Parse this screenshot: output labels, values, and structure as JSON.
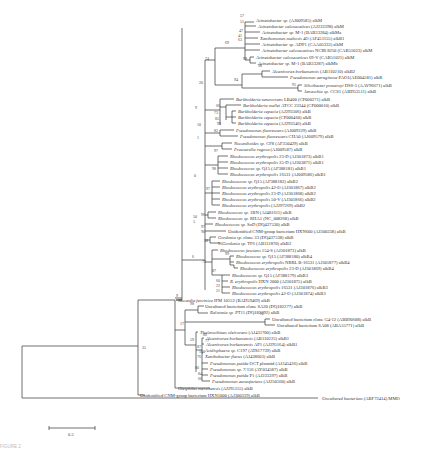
{
  "figure": {
    "type": "phylogenetic-tree",
    "caption": "FIGURE 2",
    "scale_bar": {
      "label": "0.5"
    },
    "outgroup": {
      "name": "Uncultured bacterium",
      "acc": "(ABF72414) MMO"
    }
  },
  "taxa": [
    {
      "y": 20,
      "x": 256,
      "genus": "Acinetobacter sp.",
      "rest": "(AJ009585) alkM"
    },
    {
      "y": 26,
      "x": 258,
      "genus": "Acinetobacter calcoaceticus",
      "rest": "(AJ233398) alkM"
    },
    {
      "y": 32,
      "x": 262,
      "genus": "Acinetobacter sp.",
      "rest": "M-1 (BAB33284) alkMa"
    },
    {
      "y": 38,
      "x": 260,
      "genus": "Xanthomonas maltosis",
      "rest": "4O (AF451155) alkB1"
    },
    {
      "y": 44,
      "x": 262,
      "genus": "Acinetobacter sp.",
      "rest": "ADP1 (CAA05333) alkM"
    },
    {
      "y": 50,
      "x": 262,
      "genus": "Acinetobacter calcoaceticus",
      "rest": "NCIB 8250 (CAB51023) alkM"
    },
    {
      "y": 57,
      "x": 256,
      "genus": "Acinetobacter calcoaceticus",
      "rest": "69-V (CAB51021) alkM"
    },
    {
      "y": 63,
      "x": 258,
      "genus": "Acinetobacter sp.",
      "rest": "M-1 (BAB33287) alkMb"
    },
    {
      "y": 71,
      "x": 272,
      "genus": "Alcanivorax borkumensis",
      "rest": "(AB110210) alkB2"
    },
    {
      "y": 77,
      "x": 290,
      "genus": "Pseudomonas aeruginosa",
      "rest": "PAO1(AE004581) alkB"
    },
    {
      "y": 85,
      "x": 304,
      "genus": "Silicibacter pomeroyi",
      "rest": "DSS-3 (AAV96671) alkB"
    },
    {
      "y": 91,
      "x": 304,
      "genus": "Janaschia sp.",
      "rest": "CCS1 (ABD53511) alkB"
    },
    {
      "y": 99,
      "x": 236,
      "genus": "Burkholderia xenovorans",
      "rest": "LB400 (CP000271) alkB"
    },
    {
      "y": 105,
      "x": 243,
      "genus": "Burkholderia mallei",
      "rest": "ATCC 23344 (CP000010) alkB"
    },
    {
      "y": 111,
      "x": 238,
      "genus": "Burkholderia cepacia",
      "rest": "(AJ293306) alkB"
    },
    {
      "y": 117,
      "x": 238,
      "genus": "Burkholderia cepacia",
      "rest": "(CP000460) alkB"
    },
    {
      "y": 123,
      "x": 238,
      "genus": "Burkholderia cepacia",
      "rest": "(AJ293346) alkB"
    },
    {
      "y": 130,
      "x": 236,
      "genus": "Pseudomonas fluorescens",
      "rest": "(AJ009329) alkB"
    },
    {
      "y": 136,
      "x": 240,
      "genus": "Pseudomonas fluorescens",
      "rest": "CHA0 (AJ009579) alkB"
    },
    {
      "y": 143,
      "x": 234,
      "genus": "Nocardioides sp.",
      "rest": "CF8 (AF350429) alkB"
    },
    {
      "y": 149,
      "x": 234,
      "genus": "Prauserella rugosa",
      "rest": "(AJ009587) alkB"
    },
    {
      "y": 156,
      "x": 230,
      "genus": "Rhodococcus erythropolis",
      "rest": "23-D (AJ301873) alkB1"
    },
    {
      "y": 162,
      "x": 230,
      "genus": "Rhodococcus erythropolis",
      "rest": "35-D (AJ303871) alkB1"
    },
    {
      "y": 168,
      "x": 230,
      "genus": "Rhodococcus sp.",
      "rest": "Q15 (AF388181) alkB1"
    },
    {
      "y": 174,
      "x": 230,
      "genus": "Rhodococcus erythropolis",
      "rest": "16531 (AJ009586) alkB1"
    },
    {
      "y": 181,
      "x": 222,
      "genus": "Rhodococcus sp.",
      "rest": "Q15 (AF388182) alkB2"
    },
    {
      "y": 187,
      "x": 222,
      "genus": "Rhodococcus erythropolis",
      "rest": "42-O (AJ301867) alkB2"
    },
    {
      "y": 193,
      "x": 222,
      "genus": "Rhodococcus erythropolis",
      "rest": "23-D (AJ301868) alkB2"
    },
    {
      "y": 199,
      "x": 222,
      "genus": "Rhodococcus erythropolis",
      "rest": "50-V (AJ301866) alkB2"
    },
    {
      "y": 205,
      "x": 222,
      "genus": "Rhodococcus erythropolis",
      "rest": "(AJ297269) alkB2"
    },
    {
      "y": 212,
      "x": 218,
      "genus": "Rhodococcus sp.",
      "rest": "1BN (AJ401611) alkB"
    },
    {
      "y": 218,
      "x": 218,
      "genus": "Rhodococcus sp.",
      "rest": "RHA1 (NC_008268) alkB"
    },
    {
      "y": 224,
      "x": 215,
      "genus": "Rhodococcus sp.",
      "rest": "SoD (DQ437530) alkB"
    },
    {
      "y": 231,
      "x": 228,
      "genus": "",
      "rest": "Unidentified CNM-group bacterium HXN600 (AJ300338) alkB"
    },
    {
      "y": 237,
      "x": 218,
      "genus": "Gordonia sp.",
      "rest": "clone 33 (DQ437538) alkB"
    },
    {
      "y": 243,
      "x": 222,
      "genus": "Gordonia sp.",
      "rest": "TF6 (AB112870) alkB2"
    },
    {
      "y": 250,
      "x": 220,
      "genus": "Rhodococcus fascians",
      "rest": "154-S (AJ301873) alkB"
    },
    {
      "y": 256,
      "x": 236,
      "genus": "Rhodococcus sp.",
      "rest": "Q15 (AF388180) alkB4"
    },
    {
      "y": 262,
      "x": 236,
      "genus": "Rhodococcus erythropolis",
      "rest": "NRRL B-16531 (AJ301877) alkB4"
    },
    {
      "y": 268,
      "x": 240,
      "genus": "Rhodococcus erythropolis",
      "rest": "23-D (AJ301869) alkB4"
    },
    {
      "y": 275,
      "x": 232,
      "genus": "Rhodococcus sp.",
      "rest": "Q15 (AF388179) alkB3"
    },
    {
      "y": 281,
      "x": 230,
      "genus": "R. erythropolis",
      "rest": "HXN 2000 (AJ301875) alkB"
    },
    {
      "y": 287,
      "x": 232,
      "genus": "Rhodococcus erythropolis",
      "rest": "16531 (AJ301876) alkB3"
    },
    {
      "y": 293,
      "x": 232,
      "genus": "Rhodococcus erythropolis",
      "rest": "42-O (AJ301874) alkB3"
    },
    {
      "y": 300,
      "x": 178,
      "genus": "Nocardia farcinica",
      "rest": "IFM 10152 (BAD59469) alkB"
    },
    {
      "y": 306,
      "x": 205,
      "genus": "",
      "rest": "Uncultured bacterium clone SA20 (DQ182277) alkB"
    },
    {
      "y": 312,
      "x": 210,
      "genus": "Ralstonia sp.",
      "rest": "PT11 (DQ182292) alkB"
    },
    {
      "y": 319,
      "x": 272,
      "genus": "",
      "rest": "Uncultured bacterium clone G4-12 (ABB90688) alkB"
    },
    {
      "y": 325,
      "x": 277,
      "genus": "",
      "rest": "Uncultured bacterium SA08 (ABA55771) alkB"
    },
    {
      "y": 332,
      "x": 200,
      "genus": "Thalassolituus oleivorans",
      "rest": "(AJ431700) alkB"
    },
    {
      "y": 338,
      "x": 206,
      "genus": "Alcanivorax borkumensis",
      "rest": "(AB110225) alkB1"
    },
    {
      "y": 344,
      "x": 206,
      "genus": "Alcanivorax borkumensis",
      "rest": "AP1 (AJ295164) alkB1"
    },
    {
      "y": 350,
      "x": 205,
      "genus": "Acidisphaera sp.",
      "rest": "C197 (AT817739) alkB"
    },
    {
      "y": 356,
      "x": 205,
      "genus": "Xanthobacter flavus",
      "rest": "(AJ438603) alkB"
    },
    {
      "y": 363,
      "x": 210,
      "genus": "Pseudomonas putida",
      "rest": "OCT plasmid (AJ245436) alkB"
    },
    {
      "y": 369,
      "x": 210,
      "genus": "Pseudomonas sp.",
      "rest": "7/156 (AY034587) alkB"
    },
    {
      "y": 375,
      "x": 210,
      "genus": "Pseudomonas putida",
      "rest": "P1 (AJ233397) alkB"
    },
    {
      "y": 381,
      "x": 212,
      "genus": "Pseudomonas aureofaciens",
      "rest": "(AJ250560) alkB"
    },
    {
      "y": 388,
      "x": 178,
      "genus": "Oleiphilus messinensis",
      "rest": "(AJ295155) alkB"
    },
    {
      "y": 395,
      "x": 140,
      "genus": "",
      "rest": "Unidentified CNM-group bacterium HXN1000 (AJ300339) alkB"
    }
  ],
  "bootstrap": [
    {
      "x": 248,
      "y": 18,
      "v": "57"
    },
    {
      "x": 248,
      "y": 24,
      "v": "51"
    },
    {
      "x": 247,
      "y": 33,
      "v": "47"
    },
    {
      "x": 246,
      "y": 38,
      "v": "41"
    },
    {
      "x": 246,
      "y": 42,
      "v": "63"
    },
    {
      "x": 233,
      "y": 45,
      "v": "69"
    },
    {
      "x": 213,
      "y": 61,
      "v": "74"
    },
    {
      "x": 251,
      "y": 61,
      "v": "99"
    },
    {
      "x": 266,
      "y": 68,
      "v": "98"
    },
    {
      "x": 242,
      "y": 82,
      "v": "94"
    },
    {
      "x": 300,
      "y": 87,
      "v": "95"
    },
    {
      "x": 207,
      "y": 85,
      "v": "20"
    },
    {
      "x": 224,
      "y": 108,
      "v": "66"
    },
    {
      "x": 222,
      "y": 115,
      "v": "73"
    },
    {
      "x": 223,
      "y": 121,
      "v": "85"
    },
    {
      "x": 225,
      "y": 126,
      "v": "99"
    },
    {
      "x": 205,
      "y": 127,
      "v": "10"
    },
    {
      "x": 222,
      "y": 133,
      "v": "82"
    },
    {
      "x": 203,
      "y": 110,
      "v": "9"
    },
    {
      "x": 205,
      "y": 140,
      "v": "1"
    },
    {
      "x": 222,
      "y": 153,
      "v": "97"
    },
    {
      "x": 220,
      "y": 171,
      "v": "98"
    },
    {
      "x": 202,
      "y": 178,
      "v": "0"
    },
    {
      "x": 214,
      "y": 191,
      "v": "97"
    },
    {
      "x": 201,
      "y": 219,
      "v": "50"
    },
    {
      "x": 201,
      "y": 224,
      "v": "5"
    },
    {
      "x": 209,
      "y": 217,
      "v": "96"
    },
    {
      "x": 209,
      "y": 229,
      "v": "97"
    },
    {
      "x": 209,
      "y": 234,
      "v": "90"
    },
    {
      "x": 212,
      "y": 243,
      "v": "58"
    },
    {
      "x": 226,
      "y": 246,
      "v": "96"
    },
    {
      "x": 200,
      "y": 259,
      "v": "6"
    },
    {
      "x": 210,
      "y": 264,
      "v": "72"
    },
    {
      "x": 233,
      "y": 256,
      "v": "99"
    },
    {
      "x": 220,
      "y": 273,
      "v": "87"
    },
    {
      "x": 224,
      "y": 283,
      "v": "60"
    },
    {
      "x": 224,
      "y": 288,
      "v": "22"
    },
    {
      "x": 224,
      "y": 293,
      "v": "21"
    },
    {
      "x": 184,
      "y": 298,
      "v": "9"
    },
    {
      "x": 198,
      "y": 306,
      "v": "98"
    },
    {
      "x": 268,
      "y": 316,
      "v": "92"
    },
    {
      "x": 188,
      "y": 326,
      "v": "17"
    },
    {
      "x": 198,
      "y": 342,
      "v": "59"
    },
    {
      "x": 211,
      "y": 337,
      "v": "86"
    },
    {
      "x": 213,
      "y": 343,
      "v": "77"
    },
    {
      "x": 205,
      "y": 349,
      "v": "87"
    },
    {
      "x": 207,
      "y": 354,
      "v": "100"
    },
    {
      "x": 205,
      "y": 359,
      "v": "76"
    },
    {
      "x": 203,
      "y": 370,
      "v": "80"
    },
    {
      "x": 206,
      "y": 376,
      "v": "84"
    },
    {
      "x": 206,
      "y": 381,
      "v": "66"
    },
    {
      "x": 150,
      "y": 350,
      "v": "35"
    }
  ]
}
